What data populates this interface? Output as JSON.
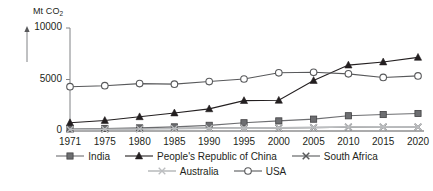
{
  "chart_data": {
    "type": "line",
    "title": "",
    "ylabel": "Mt CO2",
    "ylabel_display": "Mt CO",
    "ylabel_sub": "2",
    "xlabel": "",
    "ylim": [
      0,
      10000
    ],
    "ytick_labels": [
      "0",
      "5000",
      "10000"
    ],
    "yticks": [
      0,
      5000,
      10000
    ],
    "grid": false,
    "legend_position": "bottom",
    "categories": [
      "1971",
      "1975",
      "1980",
      "1985",
      "1990",
      "1995",
      "2000",
      "2005",
      "2010",
      "2015",
      "2020"
    ],
    "x": [
      1971,
      1975,
      1980,
      1985,
      1990,
      1995,
      2000,
      2005,
      2010,
      2015,
      2020
    ],
    "series": [
      {
        "name": "India",
        "marker": "square",
        "color": "#6d6e71",
        "values": [
          200,
          250,
          300,
          400,
          550,
          800,
          980,
          1150,
          1480,
          1600,
          1700
        ]
      },
      {
        "name": "People's Republic of China",
        "marker": "triangle",
        "color": "#231f20",
        "values": [
          800,
          1020,
          1380,
          1750,
          2150,
          2950,
          2980,
          4900,
          6400,
          6700,
          7150
        ]
      },
      {
        "name": "South Africa",
        "marker": "cross",
        "color": "#58595b",
        "values": [
          170,
          200,
          230,
          260,
          280,
          290,
          300,
          330,
          380,
          390,
          390
        ]
      },
      {
        "name": "Australia",
        "marker": "cross-light",
        "color": "#bcbec0",
        "values": [
          150,
          170,
          200,
          230,
          260,
          280,
          320,
          350,
          390,
          400,
          390
        ]
      },
      {
        "name": "USA",
        "marker": "circle",
        "color": "#58595b",
        "values": [
          4300,
          4400,
          4600,
          4550,
          4800,
          5050,
          5650,
          5700,
          5550,
          5200,
          5350
        ]
      }
    ]
  },
  "legend": {
    "rows": [
      [
        {
          "label": "India",
          "marker": "square"
        },
        {
          "label": "People's Republic of China",
          "marker": "triangle"
        },
        {
          "label": "South Africa",
          "marker": "cross"
        }
      ],
      [
        {
          "label": "Australia",
          "marker": "cross-light"
        },
        {
          "label": "USA",
          "marker": "circle"
        }
      ]
    ]
  },
  "colors": {
    "axis": "#808285",
    "text": "#231f20",
    "india": "#6d6e71",
    "china": "#231f20",
    "south_africa": "#58595b",
    "australia": "#bcbec0",
    "usa": "#58595b",
    "background": "#ffffff"
  }
}
